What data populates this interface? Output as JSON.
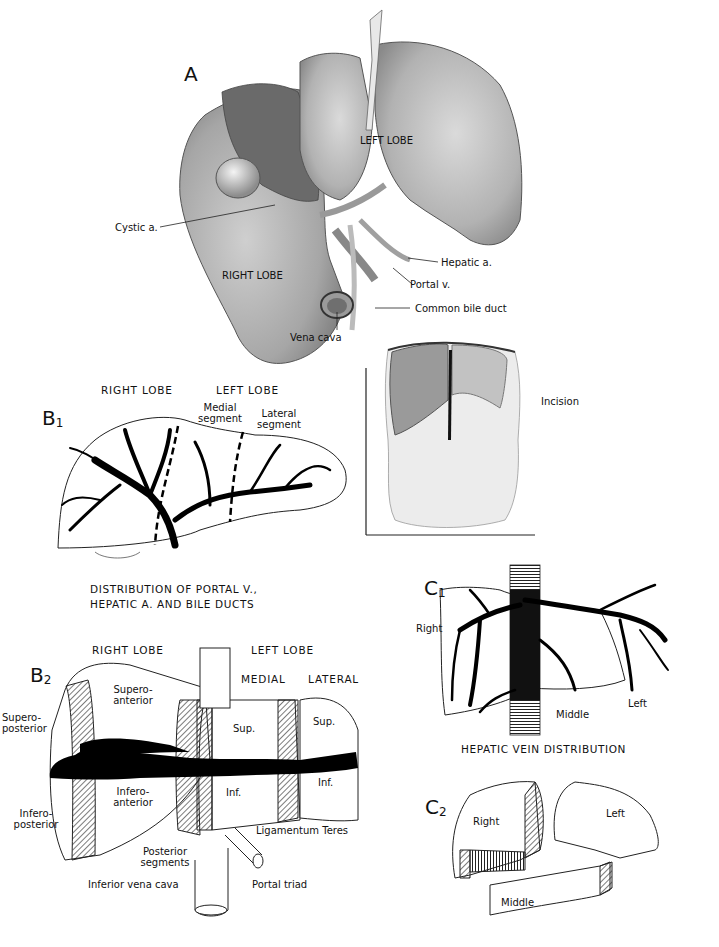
{
  "figure": {
    "panel_a": {
      "label": "A",
      "labels": {
        "left_lobe": "LEFT LOBE",
        "right_lobe": "RIGHT LOBE",
        "cystic_a": "Cystic a.",
        "hepatic_a": "Hepatic a.",
        "portal_v": "Portal v.",
        "common_bile_duct": "Common bile duct",
        "vena_cava": "Vena cava"
      }
    },
    "inset_torso": {
      "labels": {
        "incision": "Incision"
      }
    },
    "panel_b1": {
      "label": "B",
      "sub": "1",
      "headers": {
        "right_lobe": "RIGHT LOBE",
        "left_lobe": "LEFT LOBE"
      },
      "labels": {
        "medial_1": "Medial",
        "medial_2": "segment",
        "lateral_1": "Lateral",
        "lateral_2": "segment"
      },
      "caption_1": "DISTRIBUTION OF PORTAL V.,",
      "caption_2": "HEPATIC A. AND BILE DUCTS"
    },
    "panel_b2": {
      "label": "B",
      "sub": "2",
      "headers": {
        "right_lobe": "RIGHT LOBE",
        "left_lobe": "LEFT LOBE",
        "medial": "MEDIAL",
        "lateral": "LATERAL"
      },
      "labels": {
        "supero_anterior_1": "Supero-",
        "supero_anterior_2": "anterior",
        "supero_posterior_1": "Supero-",
        "supero_posterior_2": "posterior",
        "infero_anterior_1": "Infero-",
        "infero_anterior_2": "anterior",
        "infero_posterior_1": "Infero-",
        "infero_posterior_2": "posterior",
        "sup_medial": "Sup.",
        "sup_lateral": "Sup.",
        "inf_medial": "Inf.",
        "inf_lateral": "Inf.",
        "ligamentum_teres": "Ligamentum Teres",
        "posterior_segments_1": "Posterior",
        "posterior_segments_2": "segments",
        "inferior_vena_cava": "Inferior vena cava",
        "portal_triad": "Portal triad"
      }
    },
    "panel_c1": {
      "label": "C",
      "sub": "1",
      "labels": {
        "right": "Right",
        "middle": "Middle",
        "left": "Left"
      },
      "caption": "HEPATIC VEIN DISTRIBUTION"
    },
    "panel_c2": {
      "label": "C",
      "sub": "2",
      "labels": {
        "right": "Right",
        "left": "Left",
        "middle": "Middle"
      }
    }
  }
}
